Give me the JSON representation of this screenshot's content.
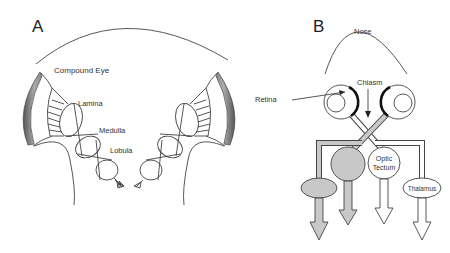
{
  "panels": {
    "a": {
      "letter": "A",
      "labels": {
        "compound_eye": "Compound Eye",
        "lamina": "Lamina",
        "medulla": "Medulla",
        "lobula": "Lobula"
      }
    },
    "b": {
      "letter": "B",
      "labels": {
        "nose": "Nose",
        "retina": "Retina",
        "chiasm": "Chiasm",
        "optic": "Optic",
        "tectum": "Tectum",
        "thalamus": "Thalamus"
      }
    }
  },
  "colors": {
    "line": "#444444",
    "gray_fill": "#c8c8c8",
    "eye_band_dark": "#555555",
    "eye_band_light": "#bbbbbb"
  }
}
